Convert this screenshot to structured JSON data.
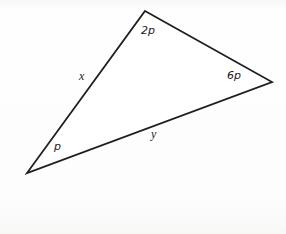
{
  "worksheet": {
    "item_number": "9.",
    "figure": {
      "type": "triangle",
      "stroke_color": "#1f1f1f",
      "fill_color": "#ffffff",
      "vertices": [
        {
          "name": "top",
          "x": 145,
          "y": 11
        },
        {
          "name": "right",
          "x": 272,
          "y": 82
        },
        {
          "name": "bottom-left",
          "x": 27,
          "y": 173
        }
      ],
      "angle_labels": [
        {
          "id": "top-angle",
          "text": "2p",
          "x": 141,
          "y": 25
        },
        {
          "id": "right-angle",
          "text": "6p",
          "x": 227,
          "y": 70
        },
        {
          "id": "bottom-left-angle",
          "text": "p",
          "x": 54,
          "y": 141
        }
      ],
      "side_labels": [
        {
          "id": "left-side",
          "text": "x",
          "x": 79,
          "y": 70
        },
        {
          "id": "bottom-side",
          "text": "y",
          "x": 151,
          "y": 128
        }
      ]
    },
    "answer_boxes": [
      {
        "id": "box-x",
        "label": "x"
      },
      {
        "id": "box-y",
        "label": "y"
      }
    ]
  }
}
